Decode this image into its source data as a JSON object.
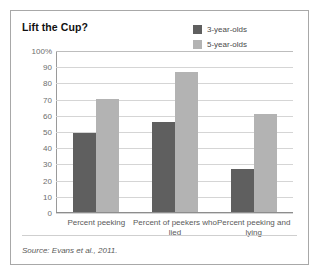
{
  "figure": {
    "title": "Lift the Cup?",
    "source": "Source: Evans et al., 2011.",
    "colors": {
      "series_3yo": "#5f5f5f",
      "series_5yo": "#b3b3b3",
      "border": "#a8a8a8",
      "gridline": "#d5d5d5"
    }
  },
  "chart_data": {
    "type": "bar",
    "title": "Lift the Cup?",
    "xlabel": "",
    "ylabel": "",
    "ylim": [
      0,
      100
    ],
    "ytick_labels": [
      "100%",
      "90",
      "80",
      "70",
      "60",
      "50",
      "40",
      "30",
      "20",
      "10",
      "0"
    ],
    "ytick_values": [
      100,
      90,
      80,
      70,
      60,
      50,
      40,
      30,
      20,
      10,
      0
    ],
    "grid": true,
    "legend_position": "top-right-inside",
    "categories": [
      "Percent peeking",
      "Percent of peekers who lied",
      "Percent peeking and lying"
    ],
    "series": [
      {
        "name": "3-year-olds",
        "color": "#5f5f5f",
        "values": [
          49,
          56,
          26.5
        ]
      },
      {
        "name": "5-year-olds",
        "color": "#b3b3b3",
        "values": [
          70.5,
          87,
          61
        ]
      }
    ],
    "annotations": [
      "Source: Evans et al., 2011."
    ]
  }
}
